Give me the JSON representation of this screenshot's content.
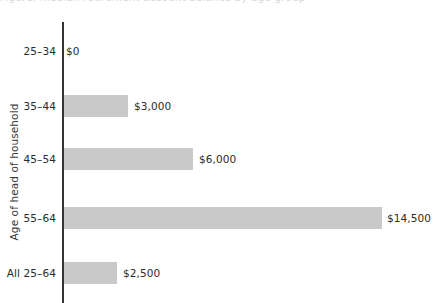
{
  "chart_data": {
    "type": "bar",
    "orientation": "horizontal",
    "title": "",
    "xlabel": "",
    "ylabel": "Age of head of household",
    "categories": [
      "25–34",
      "35–44",
      "45–54",
      "55–64",
      "All 25–64"
    ],
    "values": [
      0,
      3000,
      6000,
      14500,
      2500
    ],
    "value_labels": [
      "$0",
      "$3,000",
      "$6,000",
      "$14,500",
      "$2,500"
    ],
    "xlim": [
      0,
      14500
    ],
    "grid": false,
    "legend": false,
    "bar_color": "#c9c9c9",
    "axis_color": "#333333",
    "text_color": "#2b2b2b"
  },
  "axis": {
    "y_title": "Age of head of household"
  },
  "title_remnant": {
    "text": "Figure: median retirement account balance by age group"
  },
  "rows": [
    {
      "category": "25–34",
      "value_label": "$0",
      "bar_px": 0,
      "label_x": 66,
      "top": 40
    },
    {
      "category": "35–44",
      "value_label": "$3,000",
      "bar_px": 64,
      "label_x": 134,
      "top": 95
    },
    {
      "category": "45–54",
      "value_label": "$6,000",
      "bar_px": 129,
      "label_x": 199,
      "top": 148
    },
    {
      "category": "55–64",
      "value_label": "$14,500",
      "bar_px": 318,
      "label_x": 387,
      "top": 207
    },
    {
      "category": "All 25–64",
      "value_label": "$2,500",
      "bar_px": 53,
      "label_x": 123,
      "top": 262
    }
  ]
}
